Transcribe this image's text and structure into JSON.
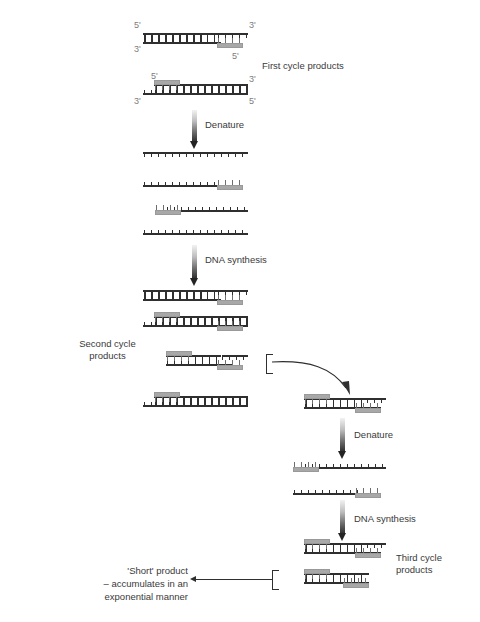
{
  "figure": {
    "type": "pcr-cycle-diagram",
    "background": "#ffffff",
    "ink": "#2f2f2f",
    "primer_color": "#a8a8a8"
  },
  "labels": {
    "first_cycle_products": "First cycle products",
    "second_cycle_products": "Second cycle\nproducts",
    "third_cycle_products": "Third cycle\nproducts",
    "denature_1": "Denature",
    "denature_2": "Denature",
    "dna_synthesis_1": "DNA synthesis",
    "dna_synthesis_2": "DNA synthesis",
    "short_product": "'Short' product\n– accumulates in an\nexponential manner"
  },
  "end_labels": {
    "d1_left_top": "5'",
    "d1_right_top": "3'",
    "d1_left_bot": "3'",
    "d1_right_bot": "5'",
    "d2_left_top": "5'",
    "d2_right_top": "3'",
    "d2_left_bot": "3'",
    "d2_right_bot": "5'"
  },
  "stages": [
    {
      "name": "first-cycle-products",
      "molecules": [
        {
          "id": "fc-duplex-1",
          "kind": "duplex",
          "primer": "bottom-right"
        },
        {
          "id": "fc-duplex-2",
          "kind": "duplex",
          "primer": "top-left"
        }
      ]
    },
    {
      "name": "denature-1-output",
      "molecules": [
        {
          "id": "dn1-strand-1",
          "kind": "single",
          "primer": "none"
        },
        {
          "id": "dn1-strand-2",
          "kind": "single",
          "primer": "right"
        },
        {
          "id": "dn1-strand-3",
          "kind": "single",
          "primer": "left"
        },
        {
          "id": "dn1-strand-4",
          "kind": "single",
          "primer": "none"
        }
      ]
    },
    {
      "name": "second-cycle-products",
      "molecules": [
        {
          "id": "sc-duplex-1",
          "kind": "duplex",
          "primer": "bottom-right"
        },
        {
          "id": "sc-duplex-2",
          "kind": "duplex",
          "primer": "top-left-and-bottom-right"
        },
        {
          "id": "sc-duplex-3",
          "kind": "duplex",
          "primer": "top-left-and-bottom-right",
          "selected": true
        },
        {
          "id": "sc-duplex-4",
          "kind": "duplex",
          "primer": "top-left"
        }
      ]
    },
    {
      "name": "third-cycle-input",
      "molecules": [
        {
          "id": "tc-duplex-in",
          "kind": "duplex",
          "primer": "top-left-and-bottom-right"
        }
      ]
    },
    {
      "name": "denature-2-output",
      "molecules": [
        {
          "id": "dn2-strand-1",
          "kind": "single",
          "primer": "left"
        },
        {
          "id": "dn2-strand-2",
          "kind": "single",
          "primer": "right"
        }
      ]
    },
    {
      "name": "third-cycle-products",
      "molecules": [
        {
          "id": "tc-duplex-1",
          "kind": "duplex",
          "primer": "top-left-and-bottom-right"
        },
        {
          "id": "tc-duplex-2",
          "kind": "duplex-short",
          "primer": "top-left-and-bottom-right",
          "short_product": true
        }
      ]
    }
  ]
}
